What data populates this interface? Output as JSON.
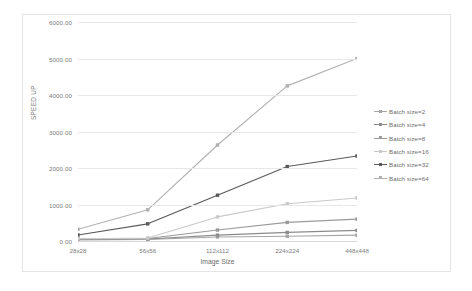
{
  "chart_data": {
    "type": "line",
    "title": "",
    "xlabel": "Image Size",
    "ylabel": "SPEED UP",
    "categories": [
      "28x28",
      "56x56",
      "112x112",
      "224x224",
      "448x448"
    ],
    "ylim": [
      0,
      6000
    ],
    "ytick_labels": [
      "0.00",
      "1000.00",
      "2000.00",
      "3000.00",
      "4000.00",
      "5000.00",
      "6000.00"
    ],
    "ytick_values": [
      0,
      1000,
      2000,
      3000,
      4000,
      5000,
      6000
    ],
    "grid": true,
    "legend_position": "right",
    "series": [
      {
        "name": "Batch size=2",
        "values": [
          30,
          40,
          110,
          130,
          160
        ],
        "color": "#a6a6a6"
      },
      {
        "name": "Batch size=4",
        "values": [
          40,
          55,
          160,
          235,
          290
        ],
        "color": "#8c8c8c"
      },
      {
        "name": "Batch size=8",
        "values": [
          55,
          70,
          300,
          510,
          600
        ],
        "color": "#9a9a9a"
      },
      {
        "name": "Batch size=16",
        "values": [
          60,
          80,
          660,
          1020,
          1180
        ],
        "color": "#c9c9c9"
      },
      {
        "name": "Batch size=32",
        "values": [
          165,
          470,
          1255,
          2040,
          2330
        ],
        "color": "#595959"
      },
      {
        "name": "Batch size=64",
        "values": [
          320,
          855,
          2630,
          4250,
          5000
        ],
        "color": "#b0b0b0"
      }
    ]
  },
  "axes": {
    "y_title": "SPEED UP",
    "x_title": "Image Size"
  },
  "legend": {
    "items": [
      {
        "label": "Batch size=2"
      },
      {
        "label": "Batch size=4"
      },
      {
        "label": "Batch size=8"
      },
      {
        "label": "Batch size=16"
      },
      {
        "label": "Batch size=32"
      },
      {
        "label": "Batch size=64"
      }
    ]
  }
}
